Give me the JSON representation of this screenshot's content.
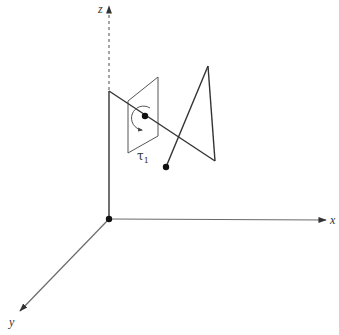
{
  "diagram": {
    "axes": {
      "x_label": "x",
      "y_label": "y",
      "z_label": "z"
    },
    "annotations": {
      "torque_symbol": "τ",
      "torque_subscript": "1"
    },
    "colors": {
      "line": "#333333",
      "axis": "#6a6a6a"
    }
  }
}
